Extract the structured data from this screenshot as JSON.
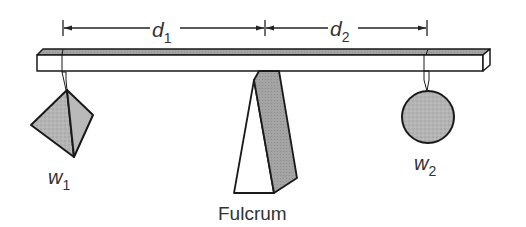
{
  "diagram": {
    "labels": {
      "d1": {
        "main": "d",
        "sub": "1"
      },
      "d2": {
        "main": "d",
        "sub": "2"
      },
      "w1": {
        "main": "w",
        "sub": "1"
      },
      "w2": {
        "main": "w",
        "sub": "2"
      },
      "fulcrum": "Fulcrum"
    },
    "objects": {
      "weight1": {
        "shape": "tetrahedron",
        "label": "w1"
      },
      "weight2": {
        "shape": "sphere",
        "label": "w2"
      },
      "beam": {
        "shape": "rectangular bar"
      },
      "fulcrum": {
        "shape": "wedge",
        "label": "Fulcrum"
      }
    },
    "colors": {
      "stroke": "#1a1a1a",
      "shade": "#a8a8a8",
      "shade_light": "#c2c2c2",
      "beam_top": "#9a9a9a",
      "text": "#333333",
      "background": "#ffffff"
    }
  }
}
